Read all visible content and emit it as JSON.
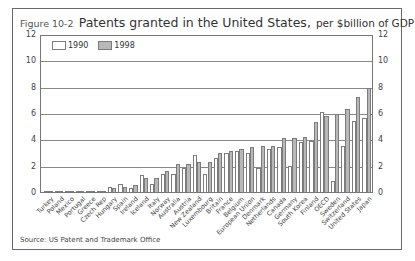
{
  "figure": {
    "label": "Figure 10-2",
    "title": "Patents granted in the United States,",
    "subtitle": "per $billion of GDP",
    "source": "Source: US Patent and Trademark Office"
  },
  "colors": {
    "series_1990": "#ffffff",
    "series_1998": "#b8b8b8",
    "border": "#7c7c7c",
    "grid": "#888888"
  },
  "chart_data": {
    "type": "bar",
    "title": "Patents granted in the United States, per $billion of GDP",
    "xlabel": "",
    "ylabel": "",
    "ylim": [
      0,
      12
    ],
    "yticks": [
      0,
      2,
      4,
      6,
      8,
      10,
      12
    ],
    "grid": true,
    "legend_position": "top-left inside",
    "categories": [
      "Turkey",
      "Poland",
      "Mexico",
      "Portugal",
      "Greece",
      "Czech Rep",
      "Hungary",
      "Spain",
      "Ireland",
      "Iceland",
      "Italy",
      "Norway",
      "Australia",
      "Austria",
      "New Zealand",
      "Luxembourg",
      "Britain",
      "France",
      "Belgium",
      "European Union",
      "Denmark",
      "Netherlands",
      "Canada",
      "Germany",
      "South Korea",
      "Finland",
      "OECD",
      "Sweden",
      "Switzerland",
      "United States",
      "Japan"
    ],
    "series": [
      {
        "name": "1990",
        "values": [
          0.0,
          0.05,
          0.05,
          0.05,
          0.1,
          0.1,
          0.4,
          0.6,
          0.3,
          1.3,
          0.6,
          1.4,
          1.4,
          1.8,
          2.8,
          1.4,
          2.6,
          3.0,
          3.1,
          3.0,
          1.8,
          3.3,
          3.4,
          2.0,
          3.8,
          3.9,
          6.1,
          0.8,
          3.5,
          5.4,
          5.6
        ]
      },
      {
        "name": "1998",
        "values": [
          0.0,
          0.05,
          0.1,
          0.1,
          0.1,
          0.1,
          0.3,
          0.4,
          0.5,
          1.1,
          1.1,
          1.6,
          2.1,
          2.1,
          2.3,
          2.3,
          3.0,
          3.1,
          3.3,
          3.4,
          3.5,
          3.5,
          4.1,
          4.1,
          4.2,
          5.3,
          5.8,
          5.9,
          6.3,
          7.2,
          7.9
        ]
      }
    ],
    "extra_right_series": {
      "note": "right-most bars extend beyond visible ordering",
      "values_1990": [
        8.1,
        8.2,
        8.4,
        8.5
      ],
      "values_1998": [
        8.0,
        8.0,
        11.5,
        12.0
      ]
    }
  },
  "axes": {
    "y_left": [
      "12",
      "10",
      "8",
      "6",
      "4",
      "2",
      "0"
    ],
    "y_right": [
      "12",
      "10",
      "8",
      "6",
      "4",
      "2",
      "0"
    ]
  },
  "legend": {
    "items": [
      {
        "label": "1990"
      },
      {
        "label": "1998"
      }
    ]
  }
}
